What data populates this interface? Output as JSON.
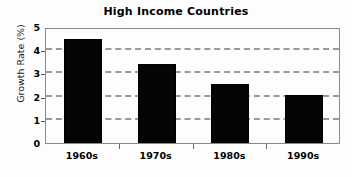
{
  "chart_data": {
    "type": "bar",
    "title": "High Income Countries",
    "xlabel": "",
    "ylabel": "Growth Rate (%)",
    "categories": [
      "1960s",
      "1970s",
      "1980s",
      "1990s"
    ],
    "values": [
      4.5,
      3.4,
      2.55,
      2.05
    ],
    "ylim": [
      0,
      5
    ],
    "y_ticks": [
      "5",
      "4",
      "3",
      "2",
      "1",
      "0"
    ],
    "y_tick_values": [
      5,
      4,
      3,
      2,
      1,
      0
    ],
    "gridlines": [
      4,
      3,
      2,
      1
    ],
    "grid": true,
    "legend": "none",
    "bar_color": "#050505",
    "grid_color": "#9a9a9a",
    "axis_color": "#8a8a8a",
    "background_color": "#fdfdfd"
  }
}
